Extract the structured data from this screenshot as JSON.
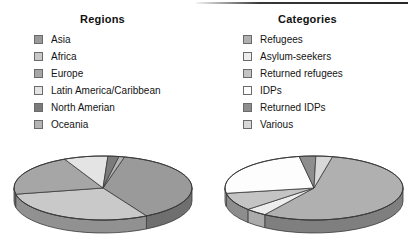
{
  "figure": {
    "background": "#ffffff",
    "charts": [
      {
        "id": "regions",
        "title": "Regions",
        "legend_items": [
          {
            "label": "Asia",
            "color": "#9a9a9a",
            "swatch_name": "legend-swatch-asia"
          },
          {
            "label": "Africa",
            "color": "#c9c9c9",
            "swatch_name": "legend-swatch-africa"
          },
          {
            "label": "Europe",
            "color": "#a6a6a6",
            "swatch_name": "legend-swatch-europe"
          },
          {
            "label": "Latin America/Caribbean",
            "color": "#e4e4e4",
            "swatch_name": "legend-swatch-latin-america-caribbean"
          },
          {
            "label": "North Amerian",
            "color": "#7b7b7b",
            "swatch_name": "legend-swatch-north-amerian"
          },
          {
            "label": "Oceania",
            "color": "#b4b4b4",
            "swatch_name": "legend-swatch-oceania"
          }
        ]
      },
      {
        "id": "categories",
        "title": "Categories",
        "legend_items": [
          {
            "label": "Refugees",
            "color": "#b0b0b0",
            "swatch_name": "legend-swatch-refugees"
          },
          {
            "label": "Asylum-seekers",
            "color": "#ededed",
            "swatch_name": "legend-swatch-asylum-seekers"
          },
          {
            "label": "Returned refugees",
            "color": "#c4c4c4",
            "swatch_name": "legend-swatch-returned-refugees"
          },
          {
            "label": "IDPs",
            "color": "#fdfdfd",
            "swatch_name": "legend-swatch-idps"
          },
          {
            "label": "Returned IDPs",
            "color": "#8e8e8e",
            "swatch_name": "legend-swatch-returned-idps"
          },
          {
            "label": "Various",
            "color": "#d8d8d8",
            "swatch_name": "legend-swatch-various"
          }
        ]
      }
    ]
  },
  "chart_data": [
    {
      "type": "pie",
      "id": "regions",
      "title": "Regions",
      "style": "3d-pie",
      "legend_position": "top",
      "categories": [
        "Asia",
        "Africa",
        "Europe",
        "Latin America/Caribbean",
        "North Amerian",
        "Oceania"
      ],
      "values": [
        38,
        30,
        21,
        8,
        2,
        1
      ],
      "unit": "percent",
      "colors": [
        "#9a9a9a",
        "#c9c9c9",
        "#a6a6a6",
        "#e4e4e4",
        "#7b7b7b",
        "#b4b4b4"
      ],
      "xlabel": "",
      "ylabel": ""
    },
    {
      "type": "pie",
      "id": "categories",
      "title": "Categories",
      "style": "3d-pie",
      "legend_position": "top",
      "categories": [
        "Refugees",
        "Asylum-seekers",
        "Returned refugees",
        "IDPs",
        "Returned IDPs",
        "Various"
      ],
      "values": [
        56,
        4,
        9,
        25,
        3,
        3
      ],
      "unit": "percent",
      "colors": [
        "#b0b0b0",
        "#ededed",
        "#c4c4c4",
        "#fdfdfd",
        "#8e8e8e",
        "#d8d8d8"
      ],
      "xlabel": "",
      "ylabel": ""
    }
  ]
}
